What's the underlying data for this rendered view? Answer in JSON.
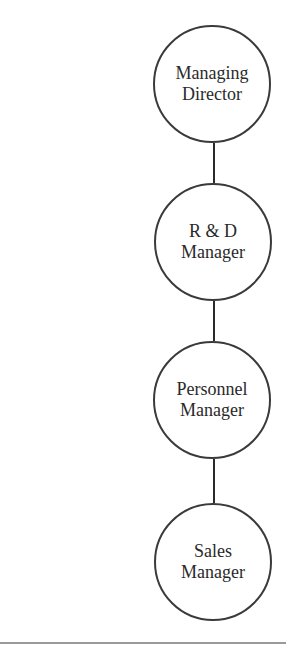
{
  "diagram": {
    "type": "org-chart",
    "orientation": "vertical",
    "nodes": [
      {
        "line1": "Managing",
        "line2": "Director"
      },
      {
        "line1": "R & D",
        "line2": "Manager"
      },
      {
        "line1": "Personnel",
        "line2": "Manager"
      },
      {
        "line1": "Sales",
        "line2": "Manager"
      }
    ],
    "edges": [
      {
        "from": "Managing Director",
        "to": "R & D Manager"
      },
      {
        "from": "R & D Manager",
        "to": "Personnel Manager"
      },
      {
        "from": "Personnel Manager",
        "to": "Sales Manager"
      }
    ],
    "colors": {
      "stroke": "#3a3a3a",
      "text": "#2a2a2a",
      "rule": "#9a9a9a",
      "background": "#ffffff"
    }
  }
}
